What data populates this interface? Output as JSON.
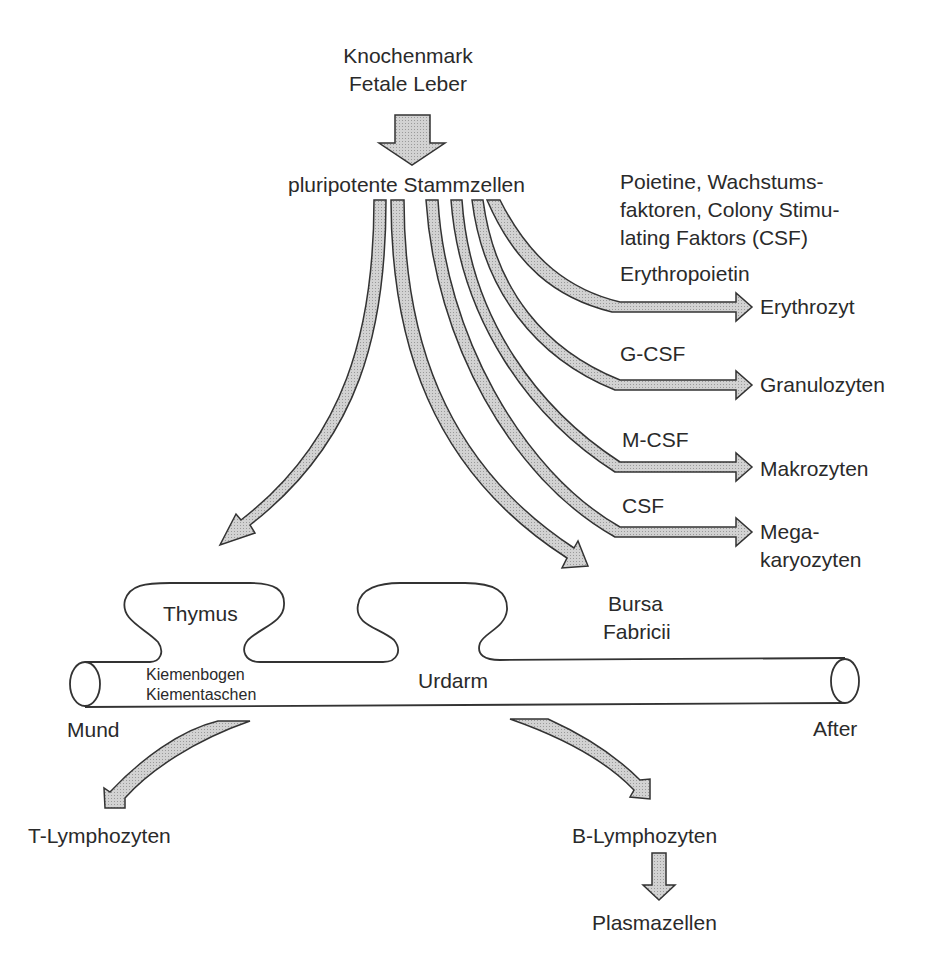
{
  "source": {
    "line1": "Knochenmark",
    "line2": "Fetale Leber"
  },
  "stem_cells": "pluripotente Stammzellen",
  "factors_header": {
    "line1": "Poietine, Wachstums-",
    "line2": "faktoren, Colony Stimu-",
    "line3": "lating Faktors (CSF)"
  },
  "pathways": [
    {
      "factor": "Erythropoietin",
      "target": "Erythrozyt"
    },
    {
      "factor": "G-CSF",
      "target": "Granulozyten"
    },
    {
      "factor": "M-CSF",
      "target": "Makrozyten"
    },
    {
      "factor": "CSF",
      "target_line1": "Mega-",
      "target_line2": "karyozyten"
    }
  ],
  "organs": {
    "thymus": "Thymus",
    "bursa_line1": "Bursa",
    "bursa_line2": "Fabricii",
    "gut": "Urdarm",
    "gill_line1": "Kiemenbogen",
    "gill_line2": "Kiementaschen",
    "mouth": "Mund",
    "anus": "After"
  },
  "lymphocytes": {
    "t_cells": "T-Lymphozyten",
    "b_cells": "B-Lymphozyten",
    "plasma_cells": "Plasmazellen"
  },
  "colors": {
    "arrow_fill": "#c4c4c4",
    "stroke": "#333333",
    "text": "#2a2a2a"
  }
}
